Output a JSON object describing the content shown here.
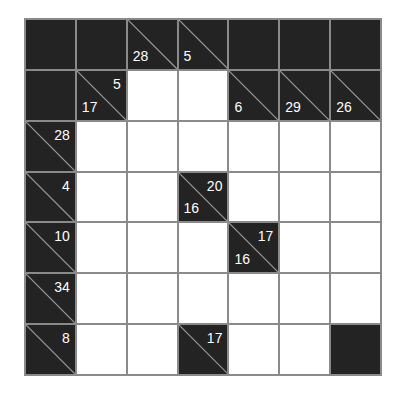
{
  "puzzle": {
    "type": "kakuro",
    "rows": 7,
    "cols": 7,
    "colors": {
      "block": "#232323",
      "grid": "#8a8a8a",
      "empty": "#ffffff",
      "clue_text": "#ffffff",
      "diagonal": "#9a9a9a"
    },
    "grid": [
      [
        {
          "t": "B"
        },
        {
          "t": "B"
        },
        {
          "t": "C",
          "down": "28"
        },
        {
          "t": "C",
          "down": "5"
        },
        {
          "t": "B"
        },
        {
          "t": "B"
        },
        {
          "t": "B"
        }
      ],
      [
        {
          "t": "B"
        },
        {
          "t": "C",
          "right": "5",
          "down": "17"
        },
        {
          "t": "W"
        },
        {
          "t": "W"
        },
        {
          "t": "C",
          "down": "6"
        },
        {
          "t": "C",
          "down": "29"
        },
        {
          "t": "C",
          "down": "26"
        }
      ],
      [
        {
          "t": "C",
          "right": "28"
        },
        {
          "t": "W"
        },
        {
          "t": "W"
        },
        {
          "t": "W"
        },
        {
          "t": "W"
        },
        {
          "t": "W"
        },
        {
          "t": "W"
        }
      ],
      [
        {
          "t": "C",
          "right": "4"
        },
        {
          "t": "W"
        },
        {
          "t": "W"
        },
        {
          "t": "C",
          "right": "20",
          "down": "16"
        },
        {
          "t": "W"
        },
        {
          "t": "W"
        },
        {
          "t": "W"
        }
      ],
      [
        {
          "t": "C",
          "right": "10"
        },
        {
          "t": "W"
        },
        {
          "t": "W"
        },
        {
          "t": "W"
        },
        {
          "t": "C",
          "right": "17",
          "down": "16"
        },
        {
          "t": "W"
        },
        {
          "t": "W"
        }
      ],
      [
        {
          "t": "C",
          "right": "34"
        },
        {
          "t": "W"
        },
        {
          "t": "W"
        },
        {
          "t": "W"
        },
        {
          "t": "W"
        },
        {
          "t": "W"
        },
        {
          "t": "W"
        }
      ],
      [
        {
          "t": "C",
          "right": "8"
        },
        {
          "t": "W"
        },
        {
          "t": "W"
        },
        {
          "t": "C",
          "right": "17"
        },
        {
          "t": "W"
        },
        {
          "t": "W"
        },
        {
          "t": "B"
        }
      ]
    ]
  }
}
